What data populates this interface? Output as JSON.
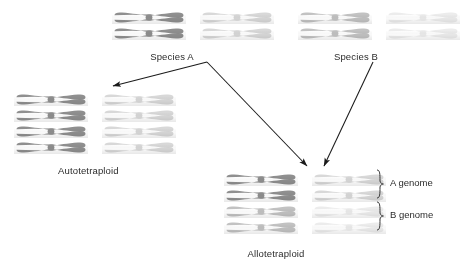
{
  "canvas": {
    "width": 474,
    "height": 273,
    "background": "#ffffff"
  },
  "labels": {
    "species_a": "Species A",
    "species_b": "Species B",
    "autotetraploid": "Autotetraploid",
    "allotetraploid": "Allotetraploid",
    "a_genome": "A genome",
    "b_genome": "B genome"
  },
  "colors": {
    "chromosome_a_dark": "#8f8f8f",
    "chromosome_a_light": "#d8d8d8",
    "chromosome_b_dark": "#c2c2c2",
    "chromosome_b_light": "#ececec",
    "arrow": "#1a1a1a",
    "text": "#2b2b2b"
  },
  "groups": {
    "species_a_parent": {
      "name": "Species A parent chromosomes",
      "x": 112,
      "y": 10,
      "rows": 2,
      "columns": [
        {
          "shade": "chromosome_a_dark",
          "offset": 0
        },
        {
          "shade": "chromosome_a_light",
          "offset": 88
        }
      ]
    },
    "species_b_parent": {
      "name": "Species B parent chromosomes",
      "x": 298,
      "y": 10,
      "rows": 2,
      "columns": [
        {
          "shade": "chromosome_b_dark",
          "offset": 0
        },
        {
          "shade": "chromosome_b_light",
          "offset": 88
        }
      ]
    },
    "autotetraploid": {
      "name": "Autotetraploid chromosomes",
      "x": 14,
      "y": 92,
      "rows": 4,
      "columns": [
        {
          "shade": "chromosome_a_dark",
          "offset": 0
        },
        {
          "shade": "chromosome_a_light",
          "offset": 88
        }
      ]
    },
    "allotetraploid_a": {
      "name": "Allotetraploid A genome chromosomes",
      "x": 224,
      "y": 172,
      "rows": 2,
      "columns": [
        {
          "shade": "chromosome_a_dark",
          "offset": 0
        },
        {
          "shade": "chromosome_a_light",
          "offset": 88
        }
      ]
    },
    "allotetraploid_b": {
      "name": "Allotetraploid B genome chromosomes",
      "x": 224,
      "y": 204,
      "rows": 2,
      "columns": [
        {
          "shade": "chromosome_b_dark",
          "offset": 0
        },
        {
          "shade": "chromosome_b_light",
          "offset": 88
        }
      ]
    }
  },
  "label_positions": {
    "species_a": {
      "x": 172,
      "y": 51
    },
    "species_b": {
      "x": 356,
      "y": 51
    },
    "autotetraploid": {
      "x": 58,
      "y": 165
    },
    "allotetraploid": {
      "x": 276,
      "y": 248
    },
    "a_genome": {
      "x": 390,
      "y": 177
    },
    "b_genome": {
      "x": 390,
      "y": 209
    }
  },
  "arrows": [
    {
      "name": "species-a-to-autotetraploid",
      "from": [
        207,
        62
      ],
      "to": [
        113,
        86
      ]
    },
    {
      "name": "species-a-to-allotetraploid",
      "from": [
        207,
        62
      ],
      "to": [
        307,
        166
      ]
    },
    {
      "name": "species-b-to-allotetraploid",
      "from": [
        373,
        62
      ],
      "to": [
        324,
        166
      ]
    }
  ],
  "braces": [
    {
      "name": "a-genome-brace",
      "x": 380,
      "top": 170,
      "bottom": 198
    },
    {
      "name": "b-genome-brace",
      "x": 380,
      "top": 202,
      "bottom": 230
    }
  ]
}
